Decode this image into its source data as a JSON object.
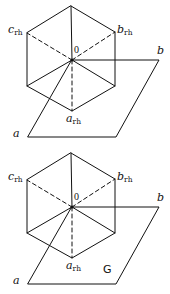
{
  "figure": {
    "panels": [
      {
        "id": "top",
        "labels": {
          "c_rh": {
            "main": "c",
            "sub": "rh"
          },
          "b_rh": {
            "main": "b",
            "sub": "rh"
          },
          "a_rh": {
            "main": "a",
            "sub": "rh"
          },
          "origin": "0",
          "b": "b",
          "a": "a"
        },
        "annotation": ""
      },
      {
        "id": "bottom",
        "labels": {
          "c_rh": {
            "main": "c",
            "sub": "rh"
          },
          "b_rh": {
            "main": "b",
            "sub": "rh"
          },
          "a_rh": {
            "main": "a",
            "sub": "rh"
          },
          "origin": "0",
          "b": "b",
          "a": "a"
        },
        "annotation": "G"
      }
    ],
    "line_color": "#111111"
  }
}
